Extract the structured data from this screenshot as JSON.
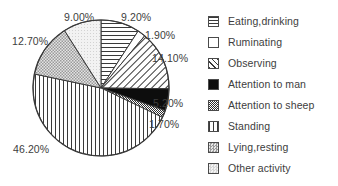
{
  "chart_data": {
    "type": "pie",
    "title": "",
    "subtitle": "",
    "xlabel": "",
    "ylabel": "",
    "grid": false,
    "legend_position": "right",
    "units": "percent",
    "start_angle_deg": 0,
    "direction": "clockwise",
    "categories": [
      "Eating,drinking",
      "Ruminating",
      "Observing",
      "Attention to man",
      "Attention to sheep",
      "Standing",
      "Lying,resting",
      "Other activity"
    ],
    "values": [
      9.2,
      1.9,
      14.1,
      5.2,
      1.7,
      46.2,
      12.7,
      9.0
    ],
    "data_labels": [
      "9.20%",
      "1.90%",
      "14.10%",
      "5.20%",
      "1.70%",
      "46.20%",
      "12.70%",
      "9.00%"
    ],
    "slices": [
      {
        "label": "Eating,drinking",
        "value": 9.2,
        "data_label": "9.20%",
        "pattern": "horizontal-lines",
        "fill": "#ffffff",
        "stroke": "#3a3a3a"
      },
      {
        "label": "Ruminating",
        "value": 1.9,
        "data_label": "1.90%",
        "pattern": "solid-white",
        "fill": "#ffffff",
        "stroke": "#3a3a3a"
      },
      {
        "label": "Observing",
        "value": 14.1,
        "data_label": "14.10%",
        "pattern": "diagonal-hatch",
        "fill": "#ffffff",
        "stroke": "#3a3a3a"
      },
      {
        "label": "Attention to man",
        "value": 5.2,
        "data_label": "5.20%",
        "pattern": "solid-black",
        "fill": "#0d0d0d",
        "stroke": "#3a3a3a"
      },
      {
        "label": "Attention to sheep",
        "value": 1.7,
        "data_label": "1.70%",
        "pattern": "dense-checker",
        "fill": "#8a8a8a",
        "stroke": "#3a3a3a"
      },
      {
        "label": "Standing",
        "value": 46.2,
        "data_label": "46.20%",
        "pattern": "vertical-lines",
        "fill": "#ffffff",
        "stroke": "#3a3a3a"
      },
      {
        "label": "Lying,resting",
        "value": 12.7,
        "data_label": "12.70%",
        "pattern": "light-checker",
        "fill": "#c9c9c9",
        "stroke": "#3a3a3a"
      },
      {
        "label": "Other activity",
        "value": 9.0,
        "data_label": "9.00%",
        "pattern": "very-light-dots",
        "fill": "#ededed",
        "stroke": "#3a3a3a"
      }
    ]
  },
  "legend": {
    "items": [
      {
        "label": "Eating,drinking",
        "swatch": "horizontal-lines-swatch"
      },
      {
        "label": "Ruminating",
        "swatch": "empty-white-swatch"
      },
      {
        "label": "Observing",
        "swatch": "diagonal-hatch-swatch"
      },
      {
        "label": "Attention to man",
        "swatch": "solid-black-swatch"
      },
      {
        "label": "Attention to sheep",
        "swatch": "dense-checker-swatch"
      },
      {
        "label": "Standing",
        "swatch": "vertical-lines-swatch"
      },
      {
        "label": "Lying,resting",
        "swatch": "light-checker-swatch"
      },
      {
        "label": "Other activity",
        "swatch": "very-light-dots-swatch"
      }
    ]
  },
  "labels": [
    {
      "text": "9.00%",
      "x": 64,
      "y": 11
    },
    {
      "text": "9.20%",
      "x": 121,
      "y": 11
    },
    {
      "text": "1.90%",
      "x": 145,
      "y": 29
    },
    {
      "text": "12.70%",
      "x": 12,
      "y": 35
    },
    {
      "text": "14.10%",
      "x": 152,
      "y": 52
    },
    {
      "text": "5.20%",
      "x": 153,
      "y": 97
    },
    {
      "text": "1.70%",
      "x": 149,
      "y": 118
    },
    {
      "text": "46.20%",
      "x": 13,
      "y": 143
    }
  ],
  "colors": {
    "background": "#ffffff",
    "outline": "#3a3a3a",
    "text": "#3d3d3d"
  }
}
